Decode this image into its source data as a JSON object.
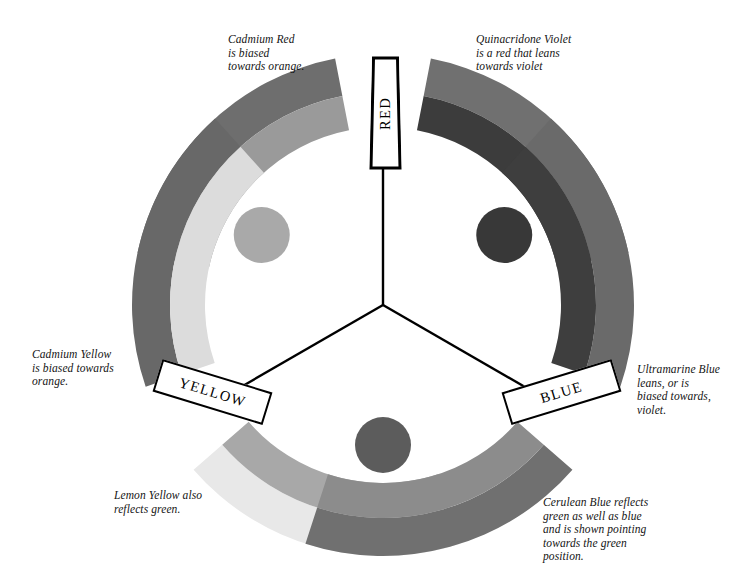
{
  "diagram": {
    "background": "#ffffff",
    "center": {
      "x": 383,
      "y": 305
    }
  },
  "primaries": [
    {
      "key": "red",
      "label": "RED",
      "angle_deg": 90
    },
    {
      "key": "yellow",
      "label": "YELLOW",
      "angle_deg": 210
    },
    {
      "key": "blue",
      "label": "BLUE",
      "angle_deg": 330
    }
  ],
  "captions": [
    {
      "name": "cadmium-red",
      "text": "Cadmium Red\nis biased\ntowards orange."
    },
    {
      "name": "quinacridone-violet",
      "text": "Quinacridone Violet\nis a red that leans\ntowards violet"
    },
    {
      "name": "cadmium-yellow",
      "text": "Cadmium Yellow\nis biased towards\norange."
    },
    {
      "name": "lemon-yellow",
      "text": "Lemon Yellow also\nreflects green."
    },
    {
      "name": "ultramarine-blue",
      "text": "Ultramarine Blue\nleans,  or is\nbiased towards,\nviolet."
    },
    {
      "name": "cerulean-blue",
      "text": "Cerulean Blue reflects\ngreen as well as blue\nand is shown pointing\ntowards the green\nposition."
    }
  ],
  "arcs": [
    {
      "name": "cadmium-red-arc",
      "primary": "red",
      "start_deg": 101,
      "end_deg": 168,
      "outer": "#6e6e6e",
      "inner": "#9a9a9a"
    },
    {
      "name": "quinacridone-violet-arc",
      "primary": "red",
      "start_deg": 12,
      "end_deg": 79,
      "outer": "#707070",
      "inner": "#3c3c3c"
    },
    {
      "name": "cadmium-yellow-arc",
      "primary": "yellow",
      "start_deg": 221,
      "end_deg": 288,
      "outer": "#e8e8e8",
      "inner": "#a8a8a8"
    },
    {
      "name": "lemon-yellow-arc",
      "primary": "yellow",
      "start_deg": 132,
      "end_deg": 199,
      "outer": "#686868",
      "inner": "#dcdcdc"
    },
    {
      "name": "ultramarine-blue-arc",
      "primary": "blue",
      "start_deg": 341,
      "end_deg": 408,
      "outer": "#6a6a6a",
      "inner": "#3e3e3e"
    },
    {
      "name": "cerulean-blue-arc",
      "primary": "blue",
      "start_deg": 252,
      "end_deg": 319,
      "outer": "#707070",
      "inner": "#8c8c8c"
    }
  ],
  "secondary_circles": [
    {
      "name": "orange-position-circle",
      "angle_deg": 150,
      "color": "#a9a9a9",
      "radius": 28
    },
    {
      "name": "violet-position-circle",
      "angle_deg": 30,
      "color": "#383838",
      "radius": 28
    },
    {
      "name": "green-position-circle",
      "angle_deg": 270,
      "color": "#5c5c5c",
      "radius": 28
    }
  ],
  "spokes": {
    "name": "primary-spokes",
    "color": "#000000",
    "width": 2.4
  },
  "chart_data": {
    "type": "pie",
    "categories": [
      "Cadmium Red",
      "Quinacridone Violet",
      "Cadmium Yellow",
      "Lemon Yellow",
      "Ultramarine Blue",
      "Cerulean Blue"
    ],
    "values": [
      67,
      67,
      67,
      67,
      67,
      67
    ],
    "legend": [
      "RED",
      "YELLOW",
      "BLUE"
    ],
    "xlabel": "",
    "ylabel": ""
  }
}
